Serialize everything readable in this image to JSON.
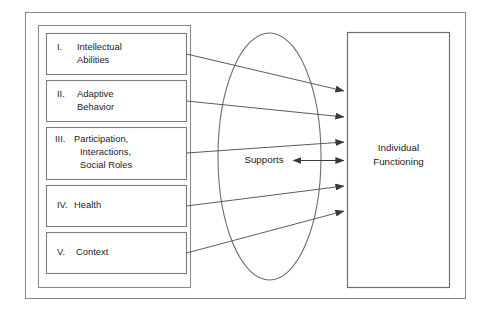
{
  "figure": {
    "background_color": "#ffffff",
    "line_color": "#4a4a4a",
    "border_color": "#8a8a8a",
    "text_color": "#1d1d1d",
    "width": 487,
    "height": 318
  },
  "dimensions": [
    {
      "numeral": "I.",
      "lines": [
        "Intellectual",
        "Abilities"
      ],
      "name": "intellectual-abilities"
    },
    {
      "numeral": "II.",
      "lines": [
        "Adaptive",
        "Behavior"
      ],
      "name": "adaptive-behavior"
    },
    {
      "numeral": "III.",
      "lines": [
        "Participation,",
        "Interactions,",
        "Social Roles"
      ],
      "name": "participation-interactions-social-roles"
    },
    {
      "numeral": "IV.",
      "lines": [
        "Health"
      ],
      "name": "health"
    },
    {
      "numeral": "V.",
      "lines": [
        "Context"
      ],
      "name": "context"
    }
  ],
  "supports": {
    "label": "Supports"
  },
  "outcome": {
    "lines": [
      "Individual",
      "Functioning"
    ]
  },
  "connectors": {
    "count": 6,
    "bidirectional_label": "supports-to-functioning"
  }
}
